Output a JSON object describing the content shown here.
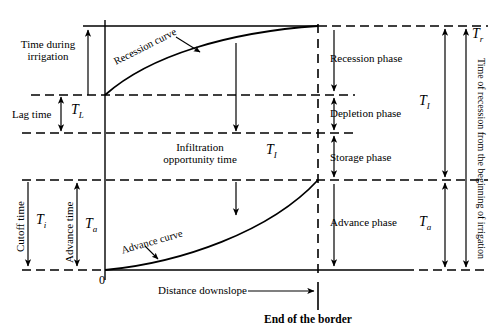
{
  "figure": {
    "type": "diagram",
    "axes": {
      "x_axis_label": "Distance downslope",
      "y_origin_label": "0",
      "end_marker_label": "End of the border"
    },
    "curves": [
      {
        "name": "recession-curve",
        "label": "Recession curve"
      },
      {
        "name": "advance-curve",
        "label": "Advance curve"
      }
    ],
    "left_labels": [
      {
        "name": "time-during-irrigation",
        "text": "Time during irrigation"
      },
      {
        "name": "lag-time",
        "text": "Lag time",
        "symbol": "T",
        "subscript": "L"
      },
      {
        "name": "cutoff-time",
        "text": "Cutoff time",
        "symbol": "T",
        "subscript": "i"
      },
      {
        "name": "advance-time",
        "text": "Advance time",
        "symbol": "T",
        "subscript": "a"
      }
    ],
    "center_labels": [
      {
        "name": "infiltration-opportunity-time",
        "text": "Infiltration opportunity time",
        "symbol": "T",
        "subscript": "I"
      }
    ],
    "phase_labels": [
      {
        "name": "recession-phase",
        "text": "Recession phase"
      },
      {
        "name": "depletion-phase",
        "text": "Depletion phase"
      },
      {
        "name": "storage-phase",
        "text": "Storage phase"
      },
      {
        "name": "advance-phase",
        "text": "Advance phase"
      }
    ],
    "right_labels": [
      {
        "name": "total-infiltration-time",
        "symbol": "T",
        "subscript": "I"
      },
      {
        "name": "total-advance-time",
        "symbol": "T",
        "subscript": "a"
      },
      {
        "name": "recession-time",
        "symbol": "T",
        "subscript": "r"
      },
      {
        "name": "recession-time-description",
        "text": "Time of recession from the beginning of irrigation"
      }
    ],
    "colors": {
      "ink": "#000000",
      "background": "#ffffff"
    }
  }
}
